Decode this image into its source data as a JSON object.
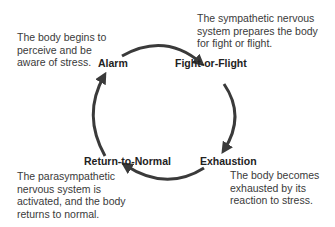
{
  "diagram": {
    "type": "cycle",
    "direction": "clockwise",
    "arrow_color": "#3a3a3a",
    "stages": [
      {
        "id": "alarm",
        "label": "Alarm",
        "description": [
          "The body begins to",
          "perceive and be",
          "aware of stress."
        ]
      },
      {
        "id": "fight-or-flight",
        "label": "Fight-or-Flight",
        "description": [
          "The sympathetic nervous",
          "system prepares the body",
          "for fight or flight."
        ]
      },
      {
        "id": "exhaustion",
        "label": "Exhaustion",
        "description": [
          "The body becomes",
          "exhausted by its",
          "reaction to stress."
        ]
      },
      {
        "id": "return-to-normal",
        "label": "Return-to-Normal",
        "description": [
          "The parasympathetic",
          "nervous system is",
          "activated, and the body",
          "returns to normal."
        ]
      }
    ]
  }
}
